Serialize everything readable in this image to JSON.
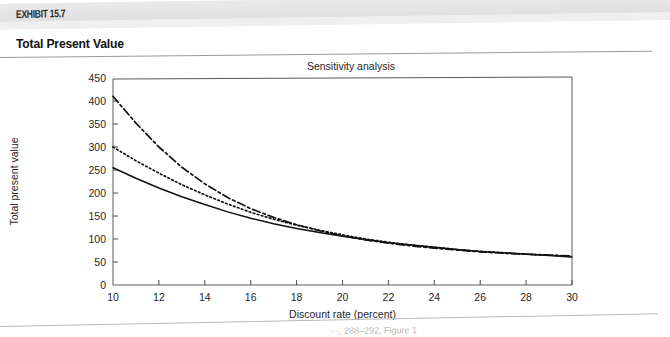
{
  "exhibit": {
    "label": "EXHIBIT 15.7",
    "title": "Total Present Value",
    "source_note": "···, 288–292, Figure 1"
  },
  "chart_data": {
    "type": "line",
    "title": "Sensitivity analysis",
    "xlabel": "Discount rate (percent)",
    "ylabel": "Total present value",
    "xlim": [
      10,
      30
    ],
    "ylim": [
      0,
      450
    ],
    "xticks": [
      10,
      12,
      14,
      16,
      18,
      20,
      22,
      24,
      26,
      28,
      30
    ],
    "yticks": [
      0,
      50,
      100,
      150,
      200,
      250,
      300,
      350,
      400,
      450
    ],
    "grid": false,
    "legend": "none",
    "x": [
      10,
      11,
      12,
      13,
      14,
      15,
      16,
      17,
      18,
      19,
      20,
      21,
      22,
      23,
      24,
      25,
      26,
      27,
      28,
      29,
      30
    ],
    "series": [
      {
        "name": "High estimate",
        "style": "dash-dot",
        "values": [
          410,
          352,
          300,
          256,
          220,
          190,
          166,
          147,
          131,
          118,
          107,
          98,
          91,
          85,
          80,
          76,
          72,
          69,
          67,
          65,
          63
        ]
      },
      {
        "name": "Middle estimate",
        "style": "dotted",
        "values": [
          300,
          270,
          243,
          218,
          196,
          176,
          158,
          143,
          130,
          119,
          109,
          100,
          93,
          87,
          82,
          77,
          73,
          70,
          67,
          65,
          62
        ]
      },
      {
        "name": "Low estimate",
        "style": "solid",
        "values": [
          255,
          232,
          211,
          192,
          175,
          159,
          145,
          133,
          123,
          114,
          106,
          99,
          92,
          87,
          82,
          77,
          73,
          70,
          67,
          64,
          61
        ]
      }
    ]
  }
}
